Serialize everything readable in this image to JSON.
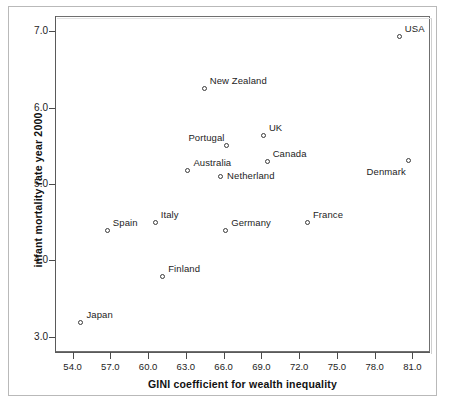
{
  "chart_data": {
    "type": "scatter",
    "title": "",
    "xlabel": "GINI coefficient for wealth inequality",
    "ylabel": "infant mortality rate year 2000",
    "xlim": [
      52.6,
      82.4
    ],
    "ylim": [
      2.8,
      7.2
    ],
    "grid": false,
    "legend": "none",
    "xticks": [
      "54.0",
      "57.0",
      "60.0",
      "63.0",
      "66.0",
      "69.0",
      "72.0",
      "75.0",
      "78.0",
      "81.0"
    ],
    "xtick_values": [
      54.0,
      57.0,
      60.0,
      63.0,
      66.0,
      69.0,
      72.0,
      75.0,
      78.0,
      81.0
    ],
    "yticks": [
      "3.0",
      "4.0",
      "5.0",
      "6.0",
      "7.0"
    ],
    "ytick_values": [
      3.0,
      4.0,
      5.0,
      6.0,
      7.0
    ],
    "points": [
      {
        "label": "Japan",
        "x": 54.7,
        "y": 3.18,
        "label_pos": "top-right"
      },
      {
        "label": "Spain",
        "x": 56.8,
        "y": 4.39,
        "label_pos": "top-right"
      },
      {
        "label": "Finland",
        "x": 61.2,
        "y": 3.78,
        "label_pos": "top-right"
      },
      {
        "label": "Italy",
        "x": 60.6,
        "y": 4.49,
        "label_pos": "top-right"
      },
      {
        "label": "Australia",
        "x": 63.2,
        "y": 5.17,
        "label_pos": "top-right"
      },
      {
        "label": "Netherland",
        "x": 65.8,
        "y": 5.09,
        "label_pos": "right"
      },
      {
        "label": "Portugal",
        "x": 66.3,
        "y": 5.5,
        "label_pos": "top-left"
      },
      {
        "label": "New Zealand",
        "x": 64.5,
        "y": 6.25,
        "label_pos": "top-right"
      },
      {
        "label": "Germany",
        "x": 66.2,
        "y": 4.39,
        "label_pos": "top-right"
      },
      {
        "label": "Canada",
        "x": 69.5,
        "y": 5.29,
        "label_pos": "top-right"
      },
      {
        "label": "UK",
        "x": 69.2,
        "y": 5.63,
        "label_pos": "top-right"
      },
      {
        "label": "France",
        "x": 72.7,
        "y": 4.49,
        "label_pos": "top-right"
      },
      {
        "label": "Denmark",
        "x": 80.7,
        "y": 5.3,
        "label_pos": "bottom-left"
      },
      {
        "label": "USA",
        "x": 80.0,
        "y": 6.92,
        "label_pos": "top-right"
      }
    ]
  },
  "colors": {
    "marker_stroke": "#3a3a3a",
    "axis": "#5a5a5a",
    "text": "#1d1d1d",
    "frame": "#b9b9b9",
    "background": "#ffffff"
  }
}
